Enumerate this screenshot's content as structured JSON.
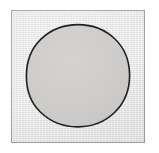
{
  "figure": {
    "caption": "",
    "label": "",
    "canvas": {
      "width": 159,
      "height": 153,
      "background_color": "#ffffff"
    },
    "frame": {
      "name": "square frame",
      "x": 11,
      "y": 10,
      "width": 134,
      "height": 133,
      "fill_color": "#e7e7e6",
      "border_color": "#9d9d9d",
      "border_width_px": 1
    },
    "shapes": [
      {
        "type": "circle",
        "name": "shaded circle",
        "center_x": 78,
        "center_y": 76,
        "radius": 52,
        "fill_color": "#cdcccb",
        "stroke_color": "#1f1f1f",
        "stroke_width_px": 1.6,
        "label": ""
      }
    ],
    "annotations": [],
    "text_items": []
  }
}
